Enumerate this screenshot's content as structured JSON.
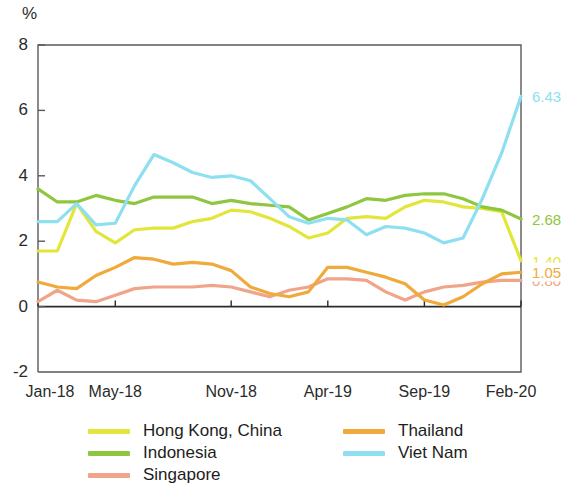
{
  "chart_data": {
    "type": "line",
    "title": "",
    "xlabel": "",
    "ylabel": "%",
    "unit_label": "%",
    "ylim": [
      -2,
      8
    ],
    "yticks": [
      8,
      6,
      4,
      2,
      0,
      -2
    ],
    "ytick_labels": [
      "8",
      "6",
      "4",
      "2",
      "0",
      "-2"
    ],
    "grid": false,
    "legend_position": "bottom",
    "x_tick_labels": [
      "Jan-18",
      "May-18",
      "Nov-18",
      "Apr-19",
      "Sep-19",
      "Feb-20"
    ],
    "x_tick_indices": [
      0,
      4,
      10,
      15,
      20,
      25
    ],
    "x": [
      "Jan-18",
      "Feb-18",
      "Mar-18",
      "Apr-18",
      "May-18",
      "Jun-18",
      "Jul-18",
      "Aug-18",
      "Sep-18",
      "Oct-18",
      "Nov-18",
      "Dec-18",
      "Jan-19",
      "Feb-19",
      "Mar-19",
      "Apr-19",
      "May-19",
      "Jun-19",
      "Jul-19",
      "Aug-19",
      "Sep-19",
      "Oct-19",
      "Nov-19",
      "Dec-19",
      "Jan-20",
      "Feb-20"
    ],
    "series": [
      {
        "name": "Hong Kong, China",
        "color": "#e2e63a",
        "end_label": "1.40",
        "values": [
          1.7,
          1.7,
          3.15,
          2.3,
          1.95,
          2.35,
          2.4,
          2.4,
          2.6,
          2.7,
          2.95,
          2.9,
          2.7,
          2.45,
          2.1,
          2.25,
          2.7,
          2.75,
          2.7,
          3.05,
          3.25,
          3.2,
          3.05,
          3.0,
          2.9,
          1.4
        ]
      },
      {
        "name": "Indonesia",
        "color": "#8fc640",
        "end_label": "2.68",
        "values": [
          3.6,
          3.2,
          3.2,
          3.4,
          3.25,
          3.15,
          3.35,
          3.35,
          3.35,
          3.15,
          3.25,
          3.15,
          3.1,
          3.05,
          2.65,
          2.85,
          3.05,
          3.3,
          3.25,
          3.4,
          3.45,
          3.45,
          3.3,
          3.05,
          2.95,
          2.68
        ]
      },
      {
        "name": "Singapore",
        "color": "#f0a489",
        "end_label": "0.80",
        "values": [
          0.15,
          0.5,
          0.2,
          0.15,
          0.35,
          0.55,
          0.6,
          0.6,
          0.6,
          0.65,
          0.6,
          0.45,
          0.3,
          0.5,
          0.6,
          0.85,
          0.85,
          0.8,
          0.45,
          0.2,
          0.45,
          0.6,
          0.65,
          0.75,
          0.8,
          0.8
        ]
      },
      {
        "name": "Thailand",
        "color": "#f0a93b",
        "end_label": "1.05",
        "values": [
          0.75,
          0.6,
          0.55,
          0.95,
          1.2,
          1.5,
          1.45,
          1.3,
          1.35,
          1.3,
          1.1,
          0.6,
          0.4,
          0.3,
          0.45,
          1.2,
          1.2,
          1.05,
          0.9,
          0.7,
          0.2,
          0.05,
          0.3,
          0.7,
          1.0,
          1.05
        ]
      },
      {
        "name": "Viet Nam",
        "color": "#8edff0",
        "end_label": "6.43",
        "values": [
          2.6,
          2.6,
          3.15,
          2.5,
          2.55,
          3.7,
          4.65,
          4.4,
          4.1,
          3.95,
          4.0,
          3.85,
          3.3,
          2.75,
          2.55,
          2.7,
          2.65,
          2.2,
          2.45,
          2.4,
          2.25,
          1.95,
          2.1,
          3.3,
          4.7,
          6.43
        ]
      }
    ],
    "legend": [
      {
        "label": "Hong Kong, China",
        "color": "#e2e63a",
        "column": 0
      },
      {
        "label": "Indonesia",
        "color": "#8fc640",
        "column": 0
      },
      {
        "label": "Singapore",
        "color": "#f0a489",
        "column": 0
      },
      {
        "label": "Thailand",
        "color": "#f0a93b",
        "column": 1
      },
      {
        "label": "Viet Nam",
        "color": "#8edff0",
        "column": 1
      }
    ]
  }
}
